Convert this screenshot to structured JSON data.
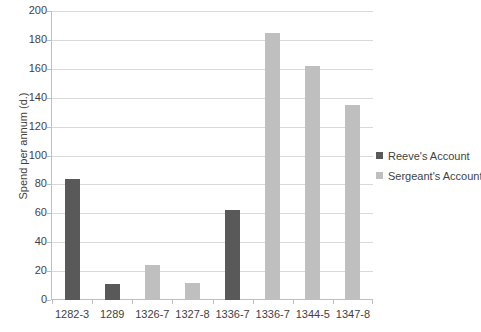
{
  "chart_data": {
    "type": "bar",
    "title": "",
    "xlabel": "",
    "ylabel": "Spend per annum (d.)",
    "categories": [
      "1282-3",
      "1289",
      "1326-7",
      "1327-8",
      "1336-7",
      "1336-7",
      "1344-5",
      "1347-8"
    ],
    "series": [
      {
        "name": "Reeve's Account",
        "color": "#595959",
        "values": [
          84,
          11,
          null,
          null,
          62,
          null,
          null,
          null
        ]
      },
      {
        "name": "Sergeant's Account",
        "color": "#bfbfbf",
        "values": [
          null,
          null,
          24,
          12,
          null,
          185,
          162,
          135
        ]
      }
    ],
    "bars": [
      {
        "category": "1282-3",
        "series": "Reeve's Account",
        "value": 84,
        "color": "#595959"
      },
      {
        "category": "1289",
        "series": "Reeve's Account",
        "value": 11,
        "color": "#595959"
      },
      {
        "category": "1326-7",
        "series": "Sergeant's Account",
        "value": 24,
        "color": "#bfbfbf"
      },
      {
        "category": "1327-8",
        "series": "Sergeant's Account",
        "value": 12,
        "color": "#bfbfbf"
      },
      {
        "category": "1336-7",
        "series": "Reeve's Account",
        "value": 62,
        "color": "#595959"
      },
      {
        "category": "1336-7",
        "series": "Sergeant's Account",
        "value": 185,
        "color": "#bfbfbf"
      },
      {
        "category": "1344-5",
        "series": "Sergeant's Account",
        "value": 162,
        "color": "#bfbfbf"
      },
      {
        "category": "1347-8",
        "series": "Sergeant's Account",
        "value": 135,
        "color": "#bfbfbf"
      }
    ],
    "ylim": [
      0,
      200
    ],
    "yticks": [
      0,
      20,
      40,
      60,
      80,
      100,
      120,
      140,
      160,
      180,
      200
    ],
    "ytick_labels": [
      "0",
      "20",
      "40",
      "60",
      "80",
      "100",
      "120",
      "140",
      "160",
      "180",
      "200"
    ],
    "grid": true,
    "legend_position": "right"
  },
  "legend": {
    "entries": [
      {
        "label": "Reeve's Account",
        "color": "#595959"
      },
      {
        "label": "Sergeant's Account",
        "color": "#bfbfbf"
      }
    ]
  },
  "colors": {
    "reeve": "#595959",
    "sergeant": "#bfbfbf",
    "gridline": "#d9d9d9",
    "axis": "#bfbfbf",
    "text": "#3f3f3f",
    "background": "#ffffff"
  }
}
